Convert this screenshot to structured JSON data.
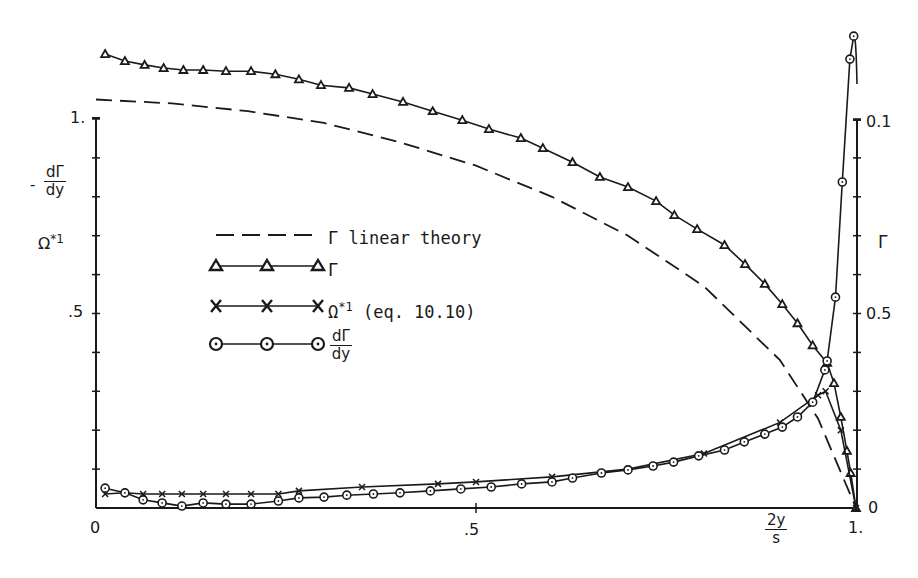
{
  "chart_data": {
    "type": "line",
    "title": "",
    "xlabel": "2y/s",
    "ylabel_left": "-dΓ/dy, Ω*1",
    "ylabel_right": "Γ",
    "xlim": [
      0,
      1
    ],
    "ylim_left": [
      0,
      1.2
    ],
    "ylim_right": [
      0,
      0.12
    ],
    "x_ticks": [
      {
        "value": 0,
        "label": "0"
      },
      {
        "value": 0.5,
        "label": ".5"
      },
      {
        "value": 1,
        "label": "1."
      }
    ],
    "y_left_ticks": [
      {
        "value": 1.0,
        "label": "1."
      },
      {
        "value": 0.5,
        "label": ".5"
      }
    ],
    "y_right_ticks": [
      {
        "value": 0.1,
        "label": "0.1"
      },
      {
        "value": 0.05,
        "label": "0.5"
      },
      {
        "value": 0,
        "label": "0"
      }
    ],
    "grid": false,
    "legend_position": "inside-left-center",
    "series": [
      {
        "name": "Γ linear theory",
        "style": "dashed",
        "marker": "none",
        "x": [
          0.0,
          0.1,
          0.2,
          0.3,
          0.4,
          0.5,
          0.6,
          0.7,
          0.8,
          0.9,
          0.95,
          1.0
        ],
        "y": [
          1.05,
          1.04,
          1.02,
          0.99,
          0.94,
          0.88,
          0.8,
          0.7,
          0.57,
          0.38,
          0.23,
          0.0
        ]
      },
      {
        "name": "Γ",
        "style": "solid",
        "marker": "triangle",
        "x": [
          0.012,
          0.038,
          0.064,
          0.089,
          0.115,
          0.141,
          0.171,
          0.204,
          0.236,
          0.267,
          0.296,
          0.333,
          0.364,
          0.404,
          0.443,
          0.482,
          0.517,
          0.559,
          0.588,
          0.627,
          0.663,
          0.7,
          0.737,
          0.761,
          0.791,
          0.827,
          0.854,
          0.88,
          0.903,
          0.923,
          0.943,
          0.962,
          0.971,
          0.98,
          0.988,
          0.993,
          1.0
        ],
        "y": [
          1.167,
          1.149,
          1.139,
          1.131,
          1.126,
          1.126,
          1.123,
          1.123,
          1.115,
          1.102,
          1.087,
          1.08,
          1.064,
          1.044,
          1.02,
          0.997,
          0.974,
          0.951,
          0.925,
          0.889,
          0.851,
          0.825,
          0.789,
          0.753,
          0.717,
          0.676,
          0.627,
          0.576,
          0.524,
          0.475,
          0.418,
          0.373,
          0.321,
          0.234,
          0.147,
          0.09,
          0.0
        ]
      },
      {
        "name": "Ω*1 (eq. 10.10)",
        "style": "solid",
        "marker": "x",
        "x": [
          0.012,
          0.038,
          0.062,
          0.087,
          0.113,
          0.141,
          0.171,
          0.204,
          0.24,
          0.267,
          0.35,
          0.45,
          0.5,
          0.6,
          0.7,
          0.8,
          0.9,
          0.95,
          0.96,
          0.98,
          1.0
        ],
        "y": [
          0.036,
          0.039,
          0.036,
          0.036,
          0.036,
          0.036,
          0.036,
          0.036,
          0.036,
          0.044,
          0.054,
          0.062,
          0.067,
          0.08,
          0.1,
          0.14,
          0.22,
          0.29,
          0.3,
          0.2,
          0.0
        ]
      },
      {
        "name": "dΓ/dy",
        "style": "solid",
        "marker": "circle",
        "x": [
          0.012,
          0.038,
          0.062,
          0.087,
          0.113,
          0.141,
          0.171,
          0.204,
          0.24,
          0.267,
          0.3,
          0.33,
          0.365,
          0.4,
          0.44,
          0.48,
          0.52,
          0.56,
          0.6,
          0.627,
          0.665,
          0.7,
          0.733,
          0.76,
          0.793,
          0.827,
          0.853,
          0.88,
          0.903,
          0.923,
          0.943,
          0.959,
          0.962,
          0.973,
          0.982,
          0.992,
          0.997
        ],
        "y": [
          0.051,
          0.039,
          0.021,
          0.013,
          0.005,
          0.013,
          0.01,
          0.01,
          0.018,
          0.026,
          0.028,
          0.033,
          0.036,
          0.039,
          0.044,
          0.049,
          0.054,
          0.062,
          0.067,
          0.077,
          0.09,
          0.098,
          0.108,
          0.118,
          0.134,
          0.149,
          0.17,
          0.19,
          0.208,
          0.234,
          0.272,
          0.355,
          0.378,
          0.542,
          0.838,
          1.154,
          1.213
        ]
      }
    ],
    "annotations": []
  },
  "legend": {
    "items": [
      {
        "label": "Γ linear theory",
        "marker": "none",
        "style": "dashed"
      },
      {
        "label": "Γ",
        "marker": "triangle",
        "style": "solid"
      },
      {
        "label_main": "Ω",
        "label_sup": "*1",
        "label_rest": " (eq. 10.10)",
        "marker": "x",
        "style": "solid"
      },
      {
        "label_num": "dΓ",
        "label_den": "dy",
        "marker": "circle",
        "style": "solid"
      }
    ]
  },
  "axes": {
    "left_label_minus": "-",
    "left_label_num": "dΓ",
    "left_label_den": "dy",
    "left_label_omega": "Ω",
    "left_label_omega_sup": "*1",
    "right_label": "Γ",
    "x_label_num": "2y",
    "x_label_den": "s",
    "x_tick_0": "0",
    "x_tick_05": ".5",
    "x_tick_1": "1.",
    "y_left_tick_1": "1.",
    "y_left_tick_05": ".5",
    "y_right_tick_01": "0.1",
    "y_right_tick_05": "0.5",
    "y_right_tick_0": "0"
  },
  "colors": {
    "ink": "#1a1a1a",
    "background": "#ffffff"
  }
}
